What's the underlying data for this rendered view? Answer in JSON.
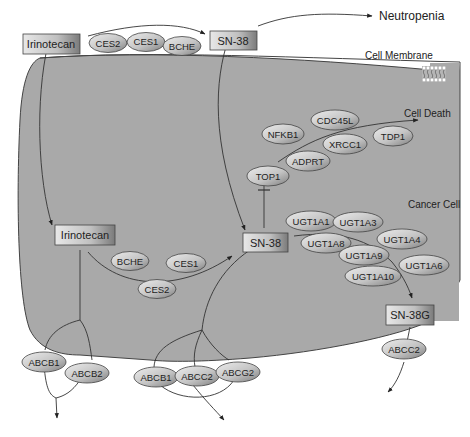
{
  "labels": {
    "neutropenia": "Neutropenia",
    "cell_membrane": "Cell Membrane",
    "cell_death": "Cell Death",
    "cancer_cell": "Cancer Cell"
  },
  "boxes": {
    "irinotecan_outside": "Irinotecan",
    "sn38_outside": "SN-38",
    "irinotecan_inside": "Irinotecan",
    "sn38_inside": "SN-38",
    "sn38g": "SN-38G"
  },
  "enzymes_outside": [
    "CES2",
    "CES1",
    "BCHE"
  ],
  "enzymes_inside": [
    "BCHE",
    "CES1",
    "CES2"
  ],
  "death_pathway": [
    "TOP1",
    "NFKB1",
    "CDC45L",
    "XRCC1",
    "TDP1",
    "ADPRT"
  ],
  "ugt": [
    "UGT1A1",
    "UGT1A3",
    "UGT1A8",
    "UGT1A4",
    "UGT1A9",
    "UGT1A6",
    "UGT1A10"
  ],
  "transporters": {
    "irinotecan_efflux": [
      "ABCB1",
      "ABCB2"
    ],
    "sn38_efflux": [
      "ABCB1",
      "ABCC2",
      "ABCG2"
    ],
    "sn38g_efflux": [
      "ABCC2"
    ]
  },
  "colors": {
    "cell_fill": "#a8a8a8",
    "node_light": "#e4e4e4",
    "node_dark": "#8a8a8a",
    "stroke": "#333333"
  }
}
